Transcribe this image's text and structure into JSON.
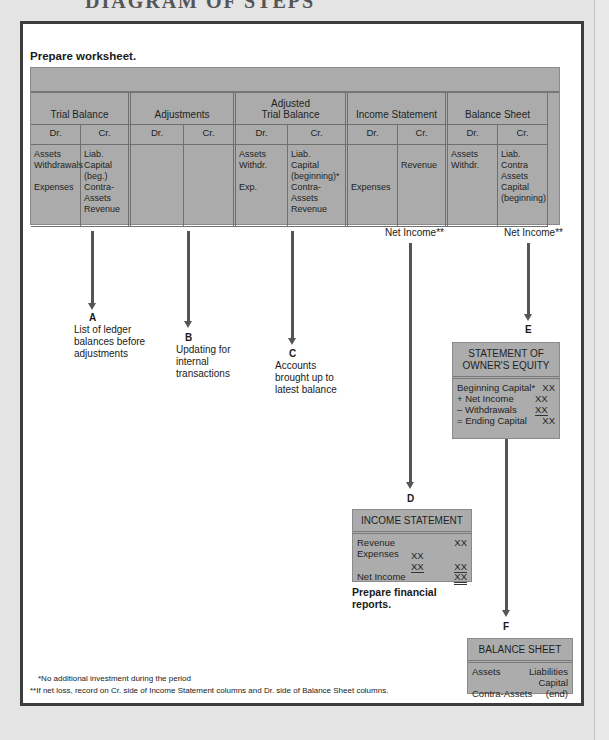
{
  "page_header": "DIAGRAM OF STEPS",
  "section_title": "Prepare worksheet.",
  "worksheet": {
    "groups": [
      {
        "label": "Trial Balance"
      },
      {
        "label": "Adjustments"
      },
      {
        "label": "Adjusted\nTrial Balance"
      },
      {
        "label": "Income Statement"
      },
      {
        "label": "Balance Sheet"
      }
    ],
    "columns": [
      "Dr.",
      "Cr.",
      "Dr.",
      "Cr.",
      "Dr.",
      "Cr.",
      "Dr.",
      "Cr.",
      "Dr.",
      "Cr."
    ],
    "contents": [
      "Assets\nWithdrawals\n\nExpenses",
      "Liab.\nCapital\n(beg.)\nContra-\nAssets\nRevenue",
      "",
      "",
      "Assets\nWithdr.\n\nExp.",
      "Liab.\nCapital\n(beginning)*\nContra-\nAssets\nRevenue",
      "\n\n\nExpenses",
      "\nRevenue",
      "Assets\nWithdr.",
      "Liab.\nContra\nAssets\nCapital\n(beginning)"
    ],
    "net_income_is": "Net Income**",
    "net_income_bs": "Net Income**"
  },
  "steps": {
    "A": {
      "letter": "A",
      "description": "List of ledger\nbalances before\nadjustments"
    },
    "B": {
      "letter": "B",
      "description": "Updating for\ninternal\ntransactions"
    },
    "C": {
      "letter": "C",
      "description": "Accounts\nbrought up to\nlatest balance"
    },
    "D": {
      "letter": "D"
    },
    "E": {
      "letter": "E"
    },
    "F": {
      "letter": "F"
    }
  },
  "owners_equity": {
    "title": "STATEMENT OF\nOWNER'S EQUITY",
    "rows": [
      {
        "label": "Beginning Capital*",
        "value": "XX"
      },
      {
        "label": "+ Net Income",
        "value": "XX"
      },
      {
        "label": "– Withdrawals",
        "value": "XX"
      },
      {
        "label": "= Ending Capital",
        "value": "XX"
      }
    ]
  },
  "income_statement": {
    "title": "INCOME STATEMENT",
    "rows": [
      {
        "label": "Revenue",
        "value": "XX"
      },
      {
        "label": "Expenses",
        "value": "XX"
      },
      {
        "label": "",
        "sub": "XX",
        "value": "XX"
      },
      {
        "label": "Net Income",
        "value": "XX"
      }
    ]
  },
  "prepare_reports": "Prepare financial\nreports.",
  "balance_sheet": {
    "title": "BALANCE SHEET",
    "assets": "Assets",
    "contra_assets": "Contra-Assets",
    "liabilities": "Liabilities",
    "capital": "Capital",
    "end": "(end)"
  },
  "footnotes": [
    "*No additional investment during the period",
    "**If net loss, record on Cr. side of Income Statement columns and Dr. side of Balance Sheet columns."
  ]
}
